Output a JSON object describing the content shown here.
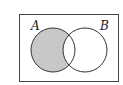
{
  "diagram": {
    "type": "venn",
    "sets": [
      {
        "label": "A",
        "shaded_region": "A only"
      },
      {
        "label": "B",
        "shaded_region": "none"
      }
    ],
    "colors": {
      "shade": "#c8c8c8",
      "stroke": "#333333",
      "background": "#ffffff"
    }
  }
}
